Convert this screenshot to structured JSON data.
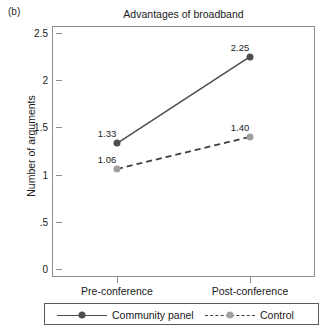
{
  "panel": {
    "letter": "(b)"
  },
  "chart_data": {
    "type": "line",
    "title": "Advantages of broadband",
    "xlabel": "",
    "ylabel": "Number of arguments",
    "categories": [
      "Pre-conference",
      "Post-conference"
    ],
    "ylim": [
      0,
      2.5
    ],
    "yticks": [
      "0",
      ".5",
      "1",
      "1.5",
      "2",
      "2.5"
    ],
    "ytick_values": [
      0,
      0.5,
      1,
      1.5,
      2,
      2.5
    ],
    "grid": false,
    "legend_position": "bottom",
    "series": [
      {
        "name": "Community panel",
        "values": [
          1.33,
          2.25
        ],
        "labels": [
          "1.33",
          "2.25"
        ],
        "line_style": "solid",
        "color": "#4d4d4d",
        "marker_color": "#4d4d4d"
      },
      {
        "name": "Control",
        "values": [
          1.06,
          1.4
        ],
        "labels": [
          "1.06",
          "1.40"
        ],
        "line_style": "dashed",
        "color": "#3f3f3f",
        "marker_color": "#a0a0a0"
      }
    ]
  },
  "axis": {
    "frame_color": "#8d8d8d"
  }
}
